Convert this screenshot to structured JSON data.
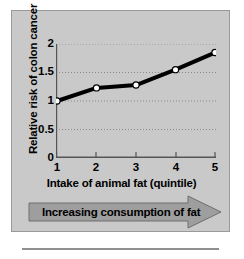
{
  "figure": {
    "panel_background": "#c9c9c9",
    "panel_border": "#9a9a9a",
    "rule_color": "#8f8f8f"
  },
  "banner": {
    "label": "Increasing consumption of fat",
    "fill": "#9e9e9e",
    "stroke": "#6e6e6e"
  },
  "chart_data": {
    "type": "line",
    "title": "",
    "xlabel": "Intake of animal fat (quintile)",
    "ylabel": "Relative risk of colon cancer",
    "x": [
      1,
      2,
      3,
      4,
      5
    ],
    "values": [
      1.0,
      1.23,
      1.28,
      1.55,
      1.85
    ],
    "xtick_labels": [
      "1",
      "2",
      "3",
      "4",
      "5"
    ],
    "ytick_labels": [
      "0",
      "0.5",
      "1",
      "1.5",
      "2"
    ],
    "ytick_values": [
      0,
      0.5,
      1,
      1.5,
      2
    ],
    "xlim": [
      1,
      5
    ],
    "ylim": [
      0,
      2
    ],
    "grid": "horizontal-dotted",
    "gridlines_at": [
      0.5,
      1,
      1.5,
      2
    ],
    "legend": "none",
    "line_color": "#000000",
    "line_width": 4,
    "marker": "circle",
    "marker_face": "#ffffff",
    "marker_edge": "#000000",
    "axis_color": "#555555",
    "grid_color": "#8a8a8a"
  }
}
